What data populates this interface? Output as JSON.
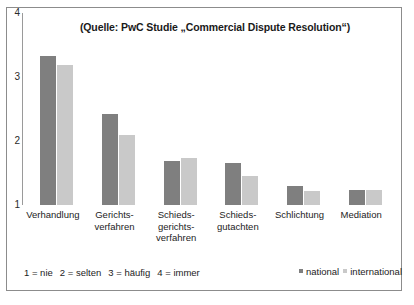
{
  "chart_data": {
    "type": "bar",
    "title": "(Quelle: PwC Studie „Commercial Dispute Resolution“)",
    "xlabel": "",
    "ylabel": "",
    "ylim": [
      1,
      4
    ],
    "yticks": [
      "1",
      "2",
      "3",
      "4"
    ],
    "grid": false,
    "legend_position": "bottom-right",
    "categories": [
      "Verhandlung",
      "Gerichts-\nverfahren",
      "Schieds-\ngerichts-\nverfahren",
      "Schieds-\ngutachten",
      "Schlichtung",
      "Mediation"
    ],
    "series": [
      {
        "name": "national",
        "color": "#7f7f7f",
        "values": [
          3.33,
          2.42,
          1.69,
          1.66,
          1.3,
          1.24
        ]
      },
      {
        "name": "international",
        "color": "#c9c9c9",
        "values": [
          3.19,
          2.09,
          1.73,
          1.46,
          1.22,
          1.24
        ]
      }
    ],
    "scale_note": {
      "items": [
        "1 = nie",
        "2 = selten",
        "3 = häufig",
        "4 = immer"
      ]
    }
  }
}
